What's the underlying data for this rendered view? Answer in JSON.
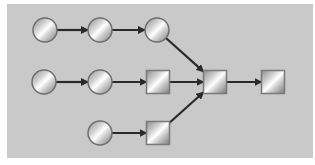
{
  "diagram": {
    "background": "#c9c9c9",
    "edge_color": "#2a2a2a",
    "nodes": [
      {
        "id": "c1",
        "shape": "circle",
        "cx": 45,
        "cy": 30
      },
      {
        "id": "c2",
        "shape": "circle",
        "cx": 100,
        "cy": 30
      },
      {
        "id": "c3",
        "shape": "circle",
        "cx": 157,
        "cy": 30
      },
      {
        "id": "c4",
        "shape": "circle",
        "cx": 44,
        "cy": 82
      },
      {
        "id": "c5",
        "shape": "circle",
        "cx": 100,
        "cy": 82
      },
      {
        "id": "s1",
        "shape": "square",
        "cx": 158,
        "cy": 82
      },
      {
        "id": "c6",
        "shape": "circle",
        "cx": 100,
        "cy": 133
      },
      {
        "id": "s2",
        "shape": "square",
        "cx": 158,
        "cy": 133
      },
      {
        "id": "s3",
        "shape": "square",
        "cx": 215,
        "cy": 82
      },
      {
        "id": "s4",
        "shape": "square",
        "cx": 273,
        "cy": 82
      }
    ],
    "edges": [
      {
        "from": "c1",
        "to": "c2"
      },
      {
        "from": "c2",
        "to": "c3"
      },
      {
        "from": "c3",
        "to": "s3"
      },
      {
        "from": "c4",
        "to": "c5"
      },
      {
        "from": "c5",
        "to": "s1"
      },
      {
        "from": "s1",
        "to": "s3"
      },
      {
        "from": "c6",
        "to": "s2"
      },
      {
        "from": "s2",
        "to": "s3"
      },
      {
        "from": "s3",
        "to": "s4"
      }
    ]
  }
}
